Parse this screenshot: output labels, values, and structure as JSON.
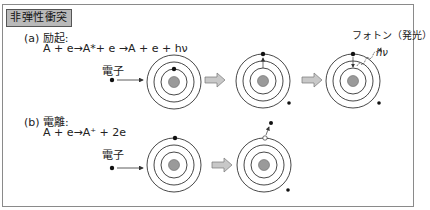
{
  "title": "非弾性衝突",
  "sections": [
    {
      "label": "(a) 励起:",
      "equation": "A + e→A*+ e →A + e + hν",
      "electron_label": "電子",
      "photon_label": "フォトン（発光）",
      "photon_symbol": "hν",
      "stages": [
        "incoming electron hits atom",
        "bound electron excited to outer orbit",
        "electron falls back emitting photon"
      ]
    },
    {
      "label": "(b) 電離:",
      "equation": "A + e→A⁺ + 2e",
      "electron_label": "電子",
      "stages": [
        "incoming electron hits atom",
        "bound electron ejected leaving hole"
      ]
    }
  ],
  "colors": {
    "frame": "#8a8a8a",
    "title_bg": "#b9b9b9",
    "nucleus": "#9a9a9a",
    "arrow_fill": "#c8c8c8",
    "arrow_stroke": "#777777",
    "orbit": "#333333",
    "electron": "#111111"
  }
}
